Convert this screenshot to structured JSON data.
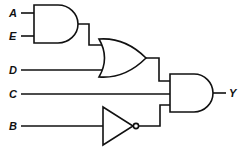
{
  "diagram": {
    "type": "logic-circuit",
    "inputs": [
      {
        "name": "A",
        "label": "A"
      },
      {
        "name": "E",
        "label": "E"
      },
      {
        "name": "D",
        "label": "D"
      },
      {
        "name": "C",
        "label": "C"
      },
      {
        "name": "B",
        "label": "B"
      }
    ],
    "output": {
      "name": "Y",
      "label": "Y"
    },
    "gates": [
      {
        "id": "and1",
        "type": "AND",
        "inputs": [
          "A",
          "E"
        ]
      },
      {
        "id": "or1",
        "type": "OR",
        "inputs": [
          "and1",
          "D"
        ]
      },
      {
        "id": "not1",
        "type": "NOT",
        "inputs": [
          "B"
        ]
      },
      {
        "id": "and2",
        "type": "AND",
        "inputs": [
          "or1",
          "C",
          "not1"
        ],
        "output": "Y"
      }
    ],
    "expression": "Y = ((A·E) + D) · C · B'",
    "colors": {
      "line": "#111111",
      "background": "#ffffff"
    }
  }
}
